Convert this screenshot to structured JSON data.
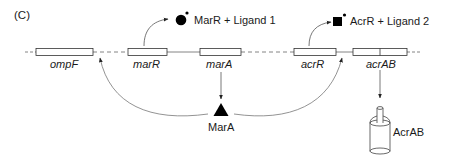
{
  "panel_label": "(C)",
  "genes": [
    {
      "name": "ompF",
      "x": 36,
      "w": 57
    },
    {
      "name": "marR",
      "x": 128,
      "w": 39
    },
    {
      "name": "marA",
      "x": 200,
      "w": 41
    },
    {
      "name": "acrR",
      "x": 294,
      "w": 42
    },
    {
      "name": "acrAB",
      "x": 353,
      "w": 54
    }
  ],
  "complexes": {
    "marr": "MarR + Ligand 1",
    "acrr": "AcrR + Ligand 2"
  },
  "proteins": {
    "mara": "MarA",
    "acrab": "AcrAB"
  },
  "colors": {
    "line": "#555555",
    "fill": "#000000",
    "box_fill": "#ffffff"
  }
}
